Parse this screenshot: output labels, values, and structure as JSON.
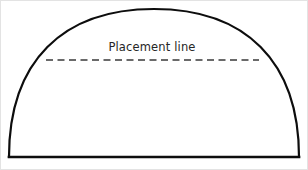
{
  "figure": {
    "name": "placement-line-dome-diagram",
    "background_color": "#ffffff",
    "border_color": "#e3e3e3",
    "width": 308,
    "height": 170
  },
  "labels": {
    "placement_line": "Placement line"
  },
  "shapes": {
    "dome": {
      "name": "dome-outline",
      "stroke_color": "#0d0d0d",
      "stroke_width": 2.2,
      "left_base_x": 8,
      "right_base_x": 298,
      "baseline_y": 156,
      "apex_x": 153,
      "apex_y": 8
    },
    "baseline": {
      "name": "baseline",
      "stroke_color": "#0d0d0d",
      "stroke_width": 2.6,
      "x1": 8,
      "y1": 156,
      "x2": 298,
      "y2": 156
    },
    "placement_line": {
      "name": "placement-dashed-line",
      "stroke_color": "#3a3a3a",
      "stroke_width": 1.7,
      "dash_length": 7,
      "gap_length": 4.5,
      "x1": 45,
      "y1": 59,
      "x2": 258,
      "y2": 59
    }
  },
  "text_placement": {
    "placement_label_x": 151,
    "placement_label_y": 50,
    "font_size": 11.5,
    "color": "#262626"
  }
}
